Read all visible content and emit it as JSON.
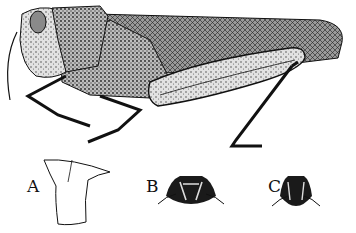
{
  "figure": {
    "panels": [
      {
        "id": "A",
        "label": "A",
        "description": "pronotum outline"
      },
      {
        "id": "B",
        "label": "B",
        "description": "head/pronotum dorsal view variant"
      },
      {
        "id": "C",
        "label": "C",
        "description": "head/pronotum dorsal view variant"
      }
    ]
  },
  "colors": {
    "ink": "#111111",
    "paper": "#ffffff",
    "stipple": "#555555"
  }
}
